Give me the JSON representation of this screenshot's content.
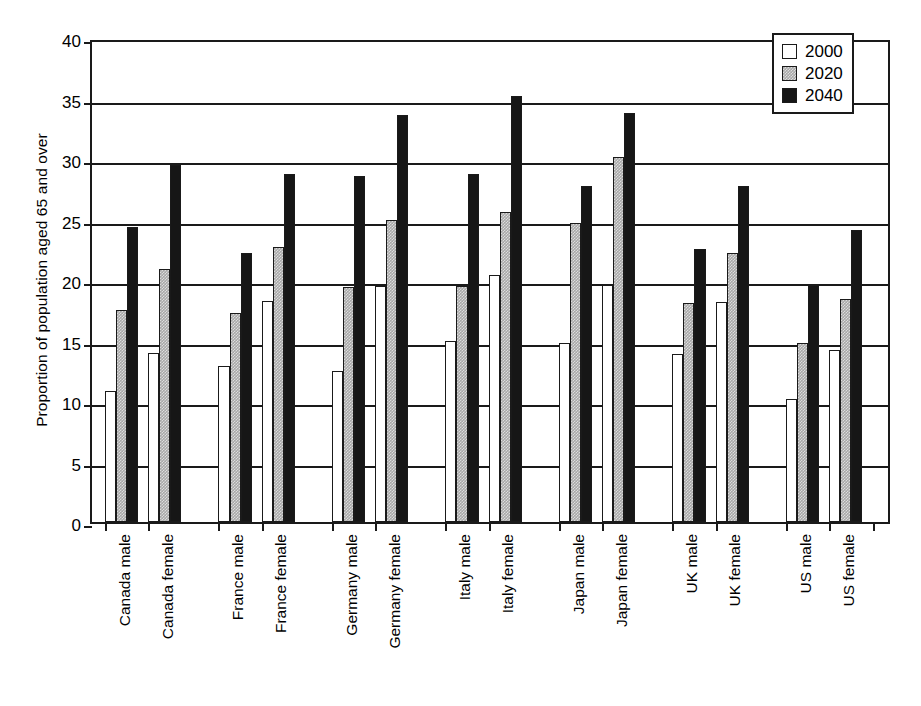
{
  "chart_data": {
    "type": "bar",
    "title": "",
    "xlabel": "",
    "ylabel": "Proportion of population aged 65 and over",
    "ylim": [
      0,
      40
    ],
    "yticks": [
      0,
      5,
      10,
      15,
      20,
      25,
      30,
      35,
      40
    ],
    "grid": true,
    "legend_position": "top-right",
    "categories": [
      "Canada male",
      "Canada female",
      "France male",
      "France female",
      "Germany male",
      "Germany female",
      "Italy male",
      "Italy female",
      "Japan male",
      "Japan female",
      "UK male",
      "UK female",
      "US male",
      "US female"
    ],
    "group_breaks_after": [
      1,
      3,
      5,
      7,
      9,
      11
    ],
    "series": [
      {
        "name": "2000",
        "color": "#ffffff",
        "values": [
          10.8,
          14.0,
          12.9,
          18.3,
          12.5,
          19.5,
          15.0,
          20.4,
          14.8,
          19.6,
          13.9,
          18.2,
          10.2,
          14.2
        ]
      },
      {
        "name": "2020",
        "color": "#a8a8a8",
        "values": [
          17.5,
          20.9,
          17.3,
          22.7,
          19.4,
          25.0,
          19.5,
          25.6,
          24.7,
          30.2,
          18.1,
          22.2,
          14.8,
          18.4
        ]
      },
      {
        "name": "2040",
        "color": "#161616",
        "values": [
          24.4,
          29.5,
          22.2,
          28.8,
          28.6,
          33.6,
          28.8,
          35.2,
          27.8,
          33.8,
          22.6,
          27.8,
          19.6,
          24.1
        ]
      }
    ]
  },
  "legend": {
    "items": [
      {
        "label": "2000"
      },
      {
        "label": "2020"
      },
      {
        "label": "2040"
      }
    ]
  },
  "axis": {
    "y_title": "Proportion of population aged 65 and over"
  }
}
